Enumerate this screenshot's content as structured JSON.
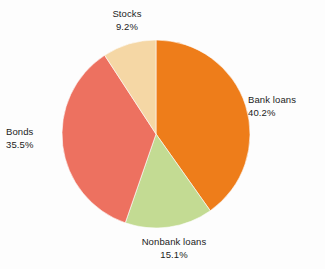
{
  "chart_data": {
    "type": "pie",
    "title": "",
    "categories": [
      "Bank loans",
      "Nonbank loans",
      "Bonds",
      "Stocks"
    ],
    "values": [
      40.2,
      15.1,
      35.5,
      9.2
    ],
    "value_suffix": "%",
    "start_angle_deg": 0,
    "direction": "clockwise",
    "legend": "none",
    "labels_position": "outside",
    "grid": false,
    "background_color": "#fdfdfd",
    "slices": [
      {
        "name": "Bank loans",
        "value": 40.2,
        "label": "Bank loans",
        "percent_label": "40.2%",
        "color": "#ee7d1a",
        "start_deg": 0,
        "end_deg": 144.72
      },
      {
        "name": "Nonbank loans",
        "value": 15.1,
        "label": "Nonbank loans",
        "percent_label": "15.1%",
        "color": "#c3db93",
        "start_deg": 144.72,
        "end_deg": 199.08
      },
      {
        "name": "Bonds",
        "value": 35.5,
        "label": "Bonds",
        "percent_label": "35.5%",
        "color": "#ed7160",
        "start_deg": 199.08,
        "end_deg": 326.88
      },
      {
        "name": "Stocks",
        "value": 9.2,
        "label": "Stocks",
        "percent_label": "9.2%",
        "color": "#f5d7a5",
        "start_deg": 326.88,
        "end_deg": 360
      }
    ]
  },
  "geometry": {
    "center_x": 156,
    "center_y": 134,
    "radius": 94
  }
}
